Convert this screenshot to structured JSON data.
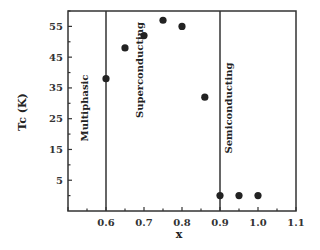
{
  "chart_data": {
    "type": "scatter",
    "title": "",
    "xlabel": "x",
    "ylabel": "Tc (K)",
    "xlim": [
      0.5,
      1.1
    ],
    "ylim": [
      -5,
      60
    ],
    "x_ticks": [
      "0.6",
      "0.7",
      "0.8",
      "0.9",
      "1.0",
      "1.1"
    ],
    "y_ticks": [
      "5",
      "15",
      "25",
      "35",
      "45",
      "55"
    ],
    "grid": false,
    "legend": null,
    "series": [
      {
        "name": "Tc",
        "x": [
          0.6,
          0.65,
          0.7,
          0.75,
          0.8,
          0.86,
          0.9,
          0.95,
          1.0
        ],
        "y": [
          38,
          48,
          52,
          57,
          55,
          32,
          0,
          0,
          0
        ]
      }
    ],
    "vertical_lines": [
      0.6,
      0.9
    ],
    "annotations": [
      "Multiphasic",
      "Superconducting",
      "Semiconducting"
    ]
  }
}
